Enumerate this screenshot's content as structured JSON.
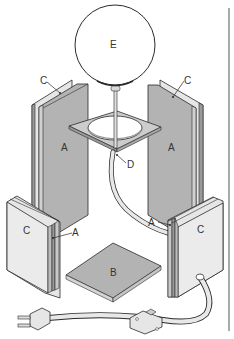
{
  "diagram": {
    "type": "exploded-assembly",
    "colors": {
      "outline": "#2a2a2a",
      "panel_gray": "#b3b3b3",
      "panel_light": "#e6e6e6",
      "edge_gray": "#9a9a9a",
      "background": "#ffffff",
      "rule": "#555555"
    },
    "labels": {
      "E": "E",
      "C_top_left": "C",
      "C_top_right": "C",
      "A_back_left": "A",
      "A_back_right": "A",
      "D": "D",
      "C_front_left": "C",
      "A_front_left": "A",
      "A_front_right": "A",
      "C_front_right": "C",
      "B": "B"
    },
    "parts": [
      {
        "id": "E",
        "name": "globe bulb"
      },
      {
        "id": "D",
        "name": "square top plate with hole"
      },
      {
        "id": "A",
        "name": "inner gray panel"
      },
      {
        "id": "C",
        "name": "outer light panel"
      },
      {
        "id": "B",
        "name": "square base"
      },
      {
        "id": "cord",
        "name": "power cord with plug and inline switch"
      }
    ]
  }
}
